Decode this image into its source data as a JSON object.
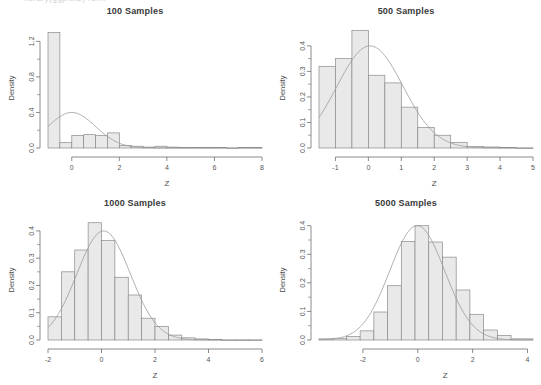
{
  "page": {
    "cut_off_top_text": "library(ggplot2)  runif",
    "background": "#ffffff",
    "bar_fill": "#e9e9e9",
    "bar_stroke": "#8a8a8a",
    "curve_color": "#9a9a9a",
    "axis_color": "#6e6e6e",
    "text_color": "#3a3a3a"
  },
  "chart_data": [
    {
      "id": "panel-100",
      "type": "bar",
      "title": "100 Samples",
      "xlabel": "Z",
      "ylabel": "Density",
      "xlim": [
        -1.0,
        8.0
      ],
      "ylim": [
        0.0,
        1.35
      ],
      "xticks": [
        0,
        2,
        4,
        6,
        8
      ],
      "xticklabels": [
        "0",
        "2",
        "4",
        "6",
        "8"
      ],
      "yticks": [
        0.0,
        0.4,
        0.8,
        1.2
      ],
      "yticklabels": [
        "0.0",
        "0.4",
        "0.8",
        "1.2"
      ],
      "grid": false,
      "bin_edges": [
        -1.0,
        -0.5,
        0.0,
        0.5,
        1.0,
        1.5,
        2.0,
        2.5,
        3.0,
        3.5,
        4.0,
        4.5,
        5.0,
        5.5,
        6.0,
        6.5,
        7.0,
        7.5,
        8.0
      ],
      "values": [
        1.3,
        0.06,
        0.14,
        0.15,
        0.14,
        0.17,
        0.03,
        0.02,
        0.01,
        0.02,
        0.01,
        0.005,
        0.005,
        0.005,
        0.005,
        0.0,
        0.005,
        0.005
      ],
      "overlay": {
        "name": "normal density curve",
        "type": "line",
        "mean": 0.0,
        "sd": 1.0,
        "peak": 0.4
      }
    },
    {
      "id": "panel-500",
      "type": "bar",
      "title": "500 Samples",
      "xlabel": "Z",
      "ylabel": "Density",
      "xlim": [
        -1.5,
        5.0
      ],
      "ylim": [
        0.0,
        0.47
      ],
      "xticks": [
        -1,
        0,
        1,
        2,
        3,
        4,
        5
      ],
      "xticklabels": [
        "-1",
        "0",
        "1",
        "2",
        "3",
        "4",
        "5"
      ],
      "yticks": [
        0.0,
        0.1,
        0.2,
        0.3,
        0.4
      ],
      "yticklabels": [
        "0.0",
        "0.1",
        "0.2",
        "0.3",
        "0.4"
      ],
      "grid": false,
      "bin_edges": [
        -1.5,
        -1.0,
        -0.5,
        0.0,
        0.5,
        1.0,
        1.5,
        2.0,
        2.5,
        3.0,
        3.5,
        4.0,
        4.5,
        5.0
      ],
      "values": [
        0.32,
        0.35,
        0.46,
        0.285,
        0.255,
        0.16,
        0.08,
        0.05,
        0.022,
        0.006,
        0.004,
        0.002,
        0.0
      ],
      "overlay": {
        "name": "normal density curve",
        "type": "line",
        "mean": 0.05,
        "sd": 1.0,
        "peak": 0.4
      }
    },
    {
      "id": "panel-1000",
      "type": "bar",
      "title": "1000 Samples",
      "xlabel": "Z",
      "ylabel": "Density",
      "xlim": [
        -2.0,
        6.0
      ],
      "ylim": [
        0.0,
        0.44
      ],
      "xticks": [
        -2,
        0,
        2,
        4,
        6
      ],
      "xticklabels": [
        "-2",
        "0",
        "2",
        "4",
        "6"
      ],
      "yticks": [
        0.0,
        0.1,
        0.2,
        0.3,
        0.4
      ],
      "yticklabels": [
        "0.0",
        "0.1",
        "0.2",
        "0.3",
        "0.4"
      ],
      "grid": false,
      "bin_edges": [
        -2.0,
        -1.5,
        -1.0,
        -0.5,
        0.0,
        0.5,
        1.0,
        1.5,
        2.0,
        2.5,
        3.0,
        3.5,
        4.0,
        4.5,
        5.0,
        5.5,
        6.0
      ],
      "values": [
        0.085,
        0.25,
        0.33,
        0.43,
        0.365,
        0.23,
        0.165,
        0.08,
        0.05,
        0.018,
        0.008,
        0.004,
        0.002,
        0.0,
        0.0,
        0.0
      ],
      "overlay": {
        "name": "normal density curve",
        "type": "line",
        "mean": 0.08,
        "sd": 1.0,
        "peak": 0.4
      }
    },
    {
      "id": "panel-5000",
      "type": "bar",
      "title": "5000 Samples",
      "xlabel": "Z",
      "ylabel": "Density",
      "xlim": [
        -3.6,
        4.2
      ],
      "ylim": [
        0.0,
        0.42
      ],
      "xticks": [
        -2,
        0,
        2,
        4
      ],
      "xticklabels": [
        "-2",
        "0",
        "2",
        "4"
      ],
      "yticks": [
        0.0,
        0.1,
        0.2,
        0.3,
        0.4
      ],
      "yticklabels": [
        "0.0",
        "0.1",
        "0.2",
        "0.3",
        "0.4"
      ],
      "grid": false,
      "bin_edges": [
        -3.6,
        -3.1,
        -2.6,
        -2.1,
        -1.6,
        -1.1,
        -0.6,
        -0.1,
        0.4,
        0.9,
        1.4,
        1.9,
        2.4,
        2.9,
        3.4,
        4.2
      ],
      "values": [
        0.004,
        0.006,
        0.012,
        0.032,
        0.098,
        0.19,
        0.345,
        0.4,
        0.343,
        0.29,
        0.175,
        0.09,
        0.035,
        0.016,
        0.004
      ],
      "overlay": {
        "name": "normal density curve",
        "type": "line",
        "mean": -0.02,
        "sd": 1.0,
        "peak": 0.4
      }
    }
  ]
}
